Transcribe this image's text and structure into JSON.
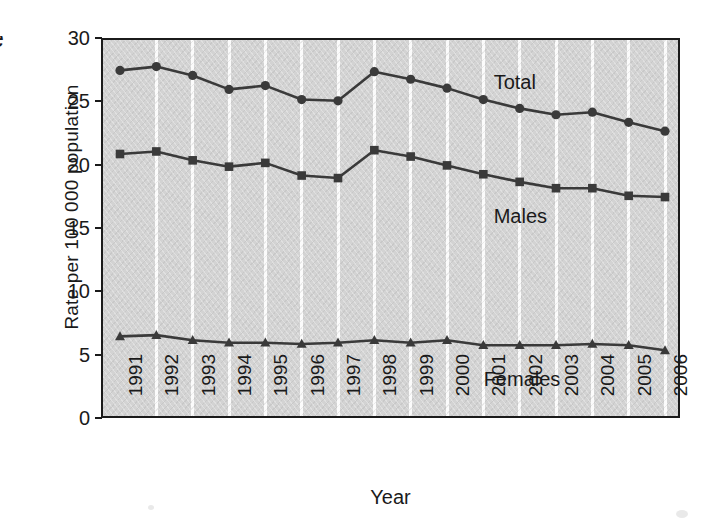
{
  "chart_data": {
    "type": "line",
    "title": "",
    "xlabel": "Year",
    "ylabel": "Rate per 100 000  population",
    "ylim": [
      0,
      30
    ],
    "yticks": [
      0,
      5,
      10,
      15,
      20,
      25,
      30
    ],
    "grid": "vertical-only",
    "legend_position": "inline-right",
    "categories": [
      "1991",
      "1992",
      "1993",
      "1994",
      "1995",
      "1996",
      "1997",
      "1998",
      "1999",
      "2000",
      "2001",
      "2002",
      "2003",
      "2004",
      "2005",
      "2006"
    ],
    "series": [
      {
        "name": "Total",
        "marker": "circle",
        "values": [
          27.6,
          27.9,
          27.2,
          26.1,
          26.4,
          25.3,
          25.2,
          27.5,
          26.9,
          26.2,
          25.3,
          24.6,
          24.1,
          24.3,
          23.5,
          22.8
        ]
      },
      {
        "name": "Males",
        "marker": "square",
        "values": [
          21.0,
          21.2,
          20.5,
          20.0,
          20.3,
          19.3,
          19.1,
          21.3,
          20.8,
          20.1,
          19.4,
          18.8,
          18.3,
          18.3,
          17.7,
          17.6
        ]
      },
      {
        "name": "Females",
        "marker": "triangle",
        "values": [
          6.6,
          6.7,
          6.3,
          6.1,
          6.1,
          6.0,
          6.1,
          6.3,
          6.1,
          6.3,
          5.9,
          5.9,
          5.9,
          6.0,
          5.9,
          5.5
        ]
      }
    ],
    "annotations": [
      {
        "text": "Total",
        "series": "Total"
      },
      {
        "text": "Males",
        "series": "Males"
      },
      {
        "text": "Females",
        "series": "Females"
      }
    ],
    "colors": {
      "line": "#3a3a3a",
      "plot_background": "#d3d3d3",
      "gridline": "#fbfbfb",
      "axis": "#1b1b1b",
      "text": "#1a1a1a"
    }
  },
  "axis": {
    "y_title": "Rate per 100 000  population",
    "x_title": "Year",
    "y_ticks": [
      "30",
      "25",
      "20",
      "15",
      "10",
      "5",
      "0"
    ]
  },
  "edge_artifact": {
    "glyph": "e"
  }
}
